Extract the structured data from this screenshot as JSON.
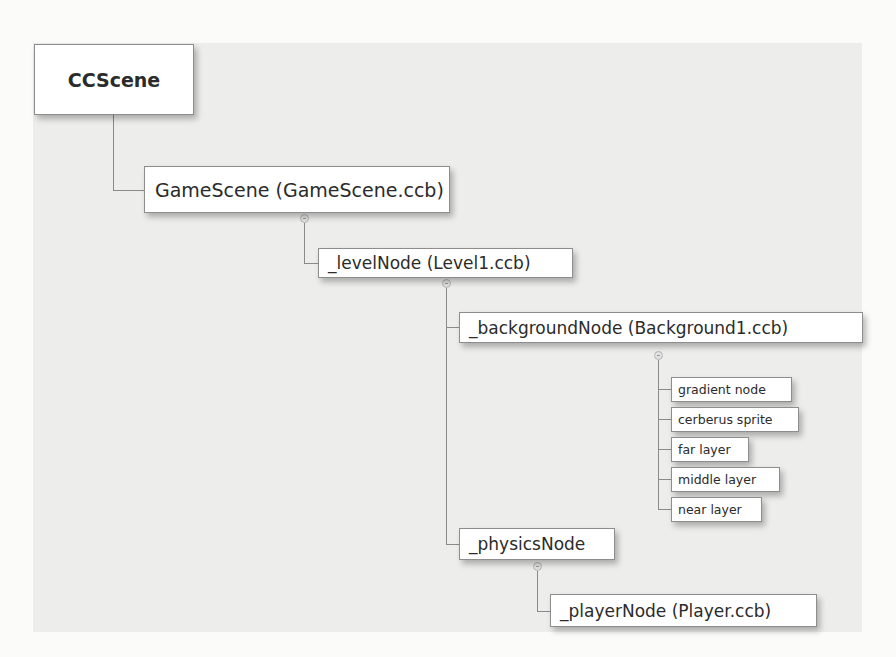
{
  "diagram": {
    "colors": {
      "panel_background": "#ededeb",
      "node_fill": "#ffffff",
      "node_border": "#8d8d8d",
      "connector": "#8a8a8a",
      "text": "#2b2b2b"
    },
    "nodes": {
      "root": {
        "label": "CCScene"
      },
      "game_scene": {
        "label": "GameScene (GameScene.ccb)"
      },
      "level_node": {
        "label": "_levelNode (Level1.ccb)"
      },
      "background_node": {
        "label": "_backgroundNode (Background1.ccb)"
      },
      "background_children": [
        {
          "label": "gradient node"
        },
        {
          "label": "cerberus sprite"
        },
        {
          "label": "far layer"
        },
        {
          "label": "middle layer"
        },
        {
          "label": "near layer"
        }
      ],
      "physics_node": {
        "label": "_physicsNode"
      },
      "player_node": {
        "label": "_playerNode (Player.ccb)"
      }
    },
    "edges": [
      [
        "CCScene",
        "GameScene (GameScene.ccb)"
      ],
      [
        "GameScene (GameScene.ccb)",
        "_levelNode (Level1.ccb)"
      ],
      [
        "_levelNode (Level1.ccb)",
        "_backgroundNode (Background1.ccb)"
      ],
      [
        "_levelNode (Level1.ccb)",
        "_physicsNode"
      ],
      [
        "_backgroundNode (Background1.ccb)",
        "gradient node"
      ],
      [
        "_backgroundNode (Background1.ccb)",
        "cerberus sprite"
      ],
      [
        "_backgroundNode (Background1.ccb)",
        "far layer"
      ],
      [
        "_backgroundNode (Background1.ccb)",
        "middle layer"
      ],
      [
        "_backgroundNode (Background1.ccb)",
        "near layer"
      ],
      [
        "_physicsNode",
        "_playerNode (Player.ccb)"
      ]
    ]
  }
}
